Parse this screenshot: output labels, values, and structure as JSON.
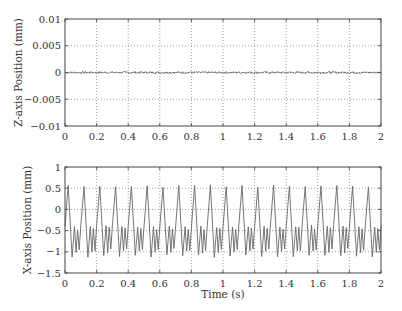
{
  "chart_data": [
    {
      "type": "line",
      "title": "",
      "xlabel": "",
      "ylabel": "Z-axis Position (mm)",
      "xlim": [
        0,
        2
      ],
      "ylim": [
        -0.01,
        0.01
      ],
      "xticks": [
        "0",
        "0.2",
        "0.4",
        "0.6",
        "0.8",
        "1",
        "1.2",
        "1.4",
        "1.6",
        "1.8",
        "2"
      ],
      "yticks": [
        "0.01",
        "0.005",
        "0",
        "-0.005",
        "-0.01"
      ],
      "grid": true,
      "series": [
        {
          "name": "Z position",
          "description": "near-zero noise signal",
          "x": [
            0,
            0.5,
            1.0,
            1.5,
            2.0
          ],
          "values": [
            0,
            0,
            0,
            0,
            0
          ],
          "noise_amplitude": 0.0002
        }
      ]
    },
    {
      "type": "line",
      "title": "",
      "xlabel": "Time (s)",
      "ylabel": "X-axis Position (mm)",
      "xlim": [
        0,
        2
      ],
      "ylim": [
        -1.5,
        1
      ],
      "xticks": [
        "0",
        "0.2",
        "0.4",
        "0.6",
        "0.8",
        "1",
        "1.2",
        "1.4",
        "1.6",
        "1.8",
        "2"
      ],
      "yticks": [
        "1",
        "0.5",
        "0",
        "-0.5",
        "-1",
        "-1.5"
      ],
      "grid": true,
      "series": [
        {
          "name": "X position",
          "description": "periodic oscillation, period ~0.1 s, peaks ~0.55, troughs ~-1.1",
          "period": 0.1,
          "one_period_x": [
            0,
            0.02,
            0.045,
            0.06,
            0.07,
            0.08,
            0.09,
            0.1
          ],
          "one_period_values": [
            -0.4,
            0.55,
            -1.1,
            -0.4,
            -1.0,
            -0.45,
            -0.95,
            -0.4
          ]
        }
      ]
    }
  ],
  "top_plot": {
    "ylabel": "Z-axis Position (mm)",
    "yticks": [
      "0.01",
      "0.005",
      "0",
      "−0.005",
      "−0.01"
    ]
  },
  "bottom_plot": {
    "ylabel": "X-axis Position (mm)",
    "xlabel": "Time (s)",
    "yticks": [
      "1",
      "0.5",
      "0",
      "−0.5",
      "−1",
      "−1.5"
    ]
  },
  "xticks": [
    "0",
    "0.2",
    "0.4",
    "0.6",
    "0.8",
    "1",
    "1.2",
    "1.4",
    "1.6",
    "1.8",
    "2"
  ]
}
